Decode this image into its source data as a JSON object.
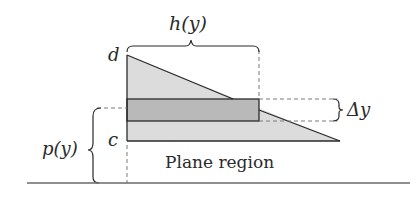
{
  "diagram": {
    "labels": {
      "h": "h(y)",
      "d": "d",
      "c": "c",
      "p": "p(y)",
      "delta_y": "Δy",
      "region": "Plane region"
    },
    "colors": {
      "triangle_fill": "#dcdcdc",
      "strip_fill": "#b9b9b9",
      "stroke": "#2a2a2a",
      "dash": "#7a7a7a"
    }
  }
}
